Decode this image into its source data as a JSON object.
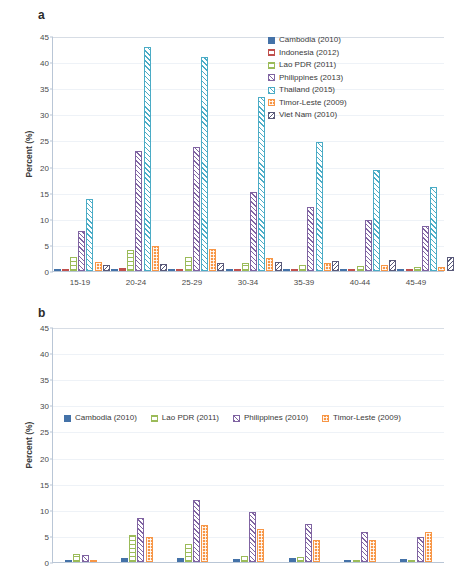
{
  "figure": {
    "panels": [
      {
        "letter": "a",
        "ylabel": "Percent (%)",
        "yticks": [
          "0",
          "5",
          "10",
          "15",
          "20",
          "25",
          "30",
          "35",
          "40",
          "45"
        ],
        "xlabels": [
          "15-19",
          "20-24",
          "25-29",
          "30-34",
          "35-39",
          "40-44",
          "45-49"
        ],
        "legend_position": "inside-top-right"
      },
      {
        "letter": "b",
        "ylabel": "Percent (%)",
        "yticks": [
          "0",
          "5",
          "10",
          "15",
          "20",
          "25",
          "30",
          "35",
          "40",
          "45"
        ],
        "xlabels": [
          "",
          "",
          "",
          "",
          "",
          "",
          ""
        ],
        "legend_position": "inside-middle-left"
      }
    ]
  },
  "colors": {
    "cambodia": "#4472a8",
    "indonesia": "#c0504d",
    "lao": "#9bbb59",
    "philippines": "#8064a2",
    "thailand": "#4bacc6",
    "timor": "#f79646",
    "vietnam": "#5a5a7a",
    "gridline": "#eef2f7",
    "axis": "#b9c6d6",
    "text": "#3a3a3a"
  },
  "chart_data": [
    {
      "type": "bar",
      "title": "a",
      "xlabel": "",
      "ylabel": "Percent (%)",
      "ylim": [
        0,
        45
      ],
      "ytick_step": 5,
      "grid": true,
      "legend": "top-right inside",
      "categories": [
        "15-19",
        "20-24",
        "25-29",
        "30-34",
        "35-39",
        "40-44",
        "45-49"
      ],
      "series": [
        {
          "name": "Cambodia (2010)",
          "color": "#4472a8",
          "pattern": "solid",
          "values": [
            0.2,
            0.3,
            0.4,
            0.4,
            0.4,
            0.3,
            0.3
          ]
        },
        {
          "name": "Indonesia (2012)",
          "color": "#c0504d",
          "pattern": "grid",
          "values": [
            0.3,
            0.5,
            0.4,
            0.3,
            0.3,
            0.2,
            0.2
          ]
        },
        {
          "name": "Lao PDR (2011)",
          "color": "#9bbb59",
          "pattern": "grid",
          "values": [
            2.6,
            4.1,
            2.7,
            1.6,
            1.2,
            0.9,
            0.7
          ]
        },
        {
          "name": "Philippines (2013)",
          "color": "#8064a2",
          "pattern": "diagonal",
          "values": [
            7.7,
            23.0,
            23.8,
            15.2,
            12.3,
            9.7,
            8.6
          ]
        },
        {
          "name": "Thailand (2015)",
          "color": "#4bacc6",
          "pattern": "diagonal-light",
          "values": [
            13.8,
            42.9,
            41.0,
            33.4,
            24.7,
            19.4,
            16.0
          ]
        },
        {
          "name": "Timor-Leste (2009)",
          "color": "#f79646",
          "pattern": "dotted",
          "values": [
            1.7,
            4.8,
            4.2,
            2.4,
            1.5,
            1.1,
            0.8
          ]
        },
        {
          "name": "Viet Nam (2010)",
          "color": "#5a5a7a",
          "pattern": "diagonal-dark",
          "values": [
            1.2,
            1.3,
            1.5,
            1.8,
            1.9,
            2.2,
            2.6
          ]
        }
      ]
    },
    {
      "type": "bar",
      "title": "b",
      "xlabel": "",
      "ylabel": "Percent (%)",
      "ylim": [
        0,
        45
      ],
      "ytick_step": 5,
      "grid": true,
      "legend": "middle-left inside",
      "categories": [
        "15-19",
        "20-24",
        "25-29",
        "30-34",
        "35-39",
        "40-44",
        "45-49"
      ],
      "series": [
        {
          "name": "Cambodia (2010)",
          "color": "#4472a8",
          "pattern": "solid",
          "values": [
            0.3,
            0.8,
            0.8,
            0.5,
            0.7,
            0.3,
            0.5
          ]
        },
        {
          "name": "Lao PDR (2011)",
          "color": "#9bbb59",
          "pattern": "grid",
          "values": [
            1.6,
            5.1,
            3.4,
            1.2,
            1.0,
            0.3,
            0.2
          ]
        },
        {
          "name": "Philippines (2010)",
          "color": "#8064a2",
          "pattern": "diagonal",
          "values": [
            1.3,
            8.4,
            11.9,
            9.5,
            7.2,
            5.7,
            4.8
          ]
        },
        {
          "name": "Timor-Leste (2009)",
          "color": "#f79646",
          "pattern": "dotted",
          "values": [
            0.3,
            4.8,
            7.0,
            6.4,
            4.3,
            4.2,
            5.8
          ]
        }
      ]
    }
  ]
}
